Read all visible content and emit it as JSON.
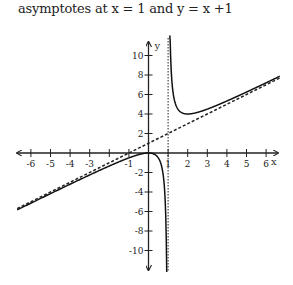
{
  "caption": "asymptotes at x = 1 and y = x +1",
  "chart_data": {
    "type": "line",
    "title": "asymptotes at x = 1 and y = x +1",
    "xlabel": "x",
    "ylabel": "y",
    "xlim": [
      -6.8,
      6.8
    ],
    "ylim": [
      -12,
      12
    ],
    "grid": false,
    "x_ticks": [
      -6,
      -5,
      -4,
      -3,
      -2,
      -1,
      1,
      2,
      3,
      4,
      5,
      6
    ],
    "x_tick_labels": [
      "-6",
      "-5",
      "-4",
      "-3",
      "",
      "-1",
      "1",
      "2",
      "3",
      "4",
      "5",
      "6"
    ],
    "y_ticks": [
      -10,
      -8,
      -6,
      -4,
      -2,
      2,
      4,
      6,
      8,
      10
    ],
    "y_tick_labels": [
      "-10",
      "-8",
      "-6",
      "-4",
      "-2",
      "2",
      "4",
      "6",
      "8",
      "10"
    ],
    "series": [
      {
        "name": "f(x) = x + 1 + 1/(x - 1)",
        "style": "solid",
        "x": [
          -6.7,
          -6,
          -5,
          -4,
          -3,
          -2,
          -1,
          0,
          0.5,
          0.8,
          0.9,
          0.95
        ],
        "y": [
          -5.83,
          -5.14,
          -4.17,
          -3.2,
          -2.25,
          -1.33,
          -0.5,
          0,
          -0.5,
          -3.2,
          -8.1,
          -18.05
        ]
      },
      {
        "name": "f(x) right branch",
        "style": "solid",
        "x": [
          1.08,
          1.1,
          1.2,
          1.5,
          2,
          3,
          4,
          5,
          6,
          6.7
        ],
        "y": [
          14.6,
          12.1,
          7.2,
          4.5,
          4,
          4.5,
          5.33,
          6.25,
          7.2,
          7.88
        ]
      },
      {
        "name": "oblique asymptote y = x + 1",
        "style": "dashed",
        "x": [
          -6.7,
          6.7
        ],
        "y": [
          -5.7,
          7.7
        ]
      },
      {
        "name": "vertical asymptote x = 1",
        "style": "dashed",
        "x": [
          1,
          1
        ],
        "y": [
          -12,
          12
        ]
      }
    ],
    "annotations": []
  }
}
